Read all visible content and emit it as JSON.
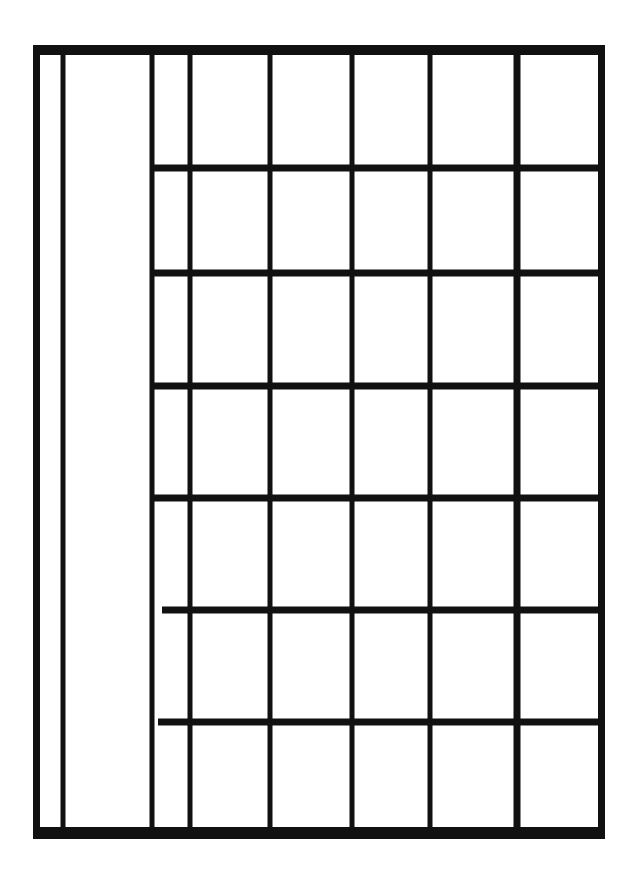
{
  "diagram": {
    "type": "hand-drawn-grid",
    "stroke_color": "#111111",
    "background": "#ffffff",
    "frame": {
      "left": 33,
      "top": 45,
      "right": 598,
      "bottom": 833,
      "top_thickness": 10,
      "bottom_thickness": 12,
      "side_thickness": 7
    },
    "vertical_lines": [
      {
        "x": 63,
        "y1": 50,
        "y2": 830,
        "w": 5
      },
      {
        "x": 152,
        "y1": 50,
        "y2": 830,
        "w": 5
      },
      {
        "x": 190,
        "y1": 50,
        "y2": 830,
        "w": 5
      },
      {
        "x": 270,
        "y1": 50,
        "y2": 830,
        "w": 5
      },
      {
        "x": 352,
        "y1": 50,
        "y2": 830,
        "w": 5
      },
      {
        "x": 430,
        "y1": 50,
        "y2": 830,
        "w": 5
      },
      {
        "x": 517,
        "y1": 50,
        "y2": 830,
        "w": 7
      }
    ],
    "horizontal_lines": [
      {
        "y": 168,
        "x1": 152,
        "x2": 598,
        "h": 7
      },
      {
        "y": 273,
        "x1": 152,
        "x2": 598,
        "h": 7
      },
      {
        "y": 386,
        "x1": 152,
        "x2": 598,
        "h": 7
      },
      {
        "y": 498,
        "x1": 152,
        "x2": 598,
        "h": 7
      },
      {
        "y": 610,
        "x1": 162,
        "x2": 598,
        "h": 7
      },
      {
        "y": 722,
        "x1": 158,
        "x2": 598,
        "h": 7
      }
    ],
    "columns": 8,
    "rows_right_section": 7,
    "text_labels": []
  }
}
